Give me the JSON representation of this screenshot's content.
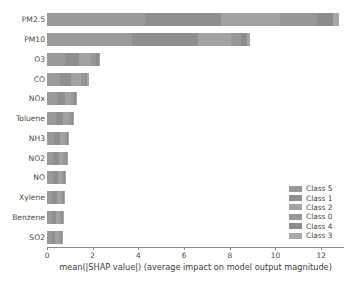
{
  "chart_data": {
    "type": "bar",
    "orientation": "horizontal",
    "stacked": true,
    "title": "",
    "xlabel": "mean(|SHAP value|) (average impact on model output magnitude)",
    "ylabel": "",
    "xlim": [
      0,
      13.0
    ],
    "grid": false,
    "legend_position": "lower-right",
    "xticks": [
      0,
      2,
      4,
      6,
      8,
      10,
      12
    ],
    "xtick_labels": [
      "0",
      "2",
      "4",
      "6",
      "8",
      "10",
      "12"
    ],
    "categories": [
      "PM2.5",
      "PM10",
      "O3",
      "CO",
      "NOx",
      "Toluene",
      "NH3",
      "NO2",
      "NO",
      "Xylene",
      "Benzene",
      "SO2"
    ],
    "series": [
      {
        "name": "Class 5",
        "color": "#9a9a9a",
        "values": [
          4.3,
          3.7,
          0.8,
          0.55,
          0.42,
          0.38,
          0.3,
          0.28,
          0.26,
          0.24,
          0.22,
          0.2
        ]
      },
      {
        "name": "Class 1",
        "color": "#8f8f8f",
        "values": [
          3.3,
          2.9,
          0.62,
          0.5,
          0.36,
          0.32,
          0.26,
          0.24,
          0.22,
          0.2,
          0.19,
          0.17
        ]
      },
      {
        "name": "Class 2",
        "color": "#a2a2a2",
        "values": [
          2.6,
          1.45,
          0.5,
          0.42,
          0.28,
          0.25,
          0.21,
          0.2,
          0.18,
          0.17,
          0.16,
          0.15
        ]
      },
      {
        "name": "Class 0",
        "color": "#979797",
        "values": [
          1.6,
          0.45,
          0.22,
          0.18,
          0.14,
          0.13,
          0.11,
          0.1,
          0.1,
          0.09,
          0.09,
          0.08
        ]
      },
      {
        "name": "Class 4",
        "color": "#8c8c8c",
        "values": [
          0.7,
          0.25,
          0.12,
          0.1,
          0.08,
          0.07,
          0.06,
          0.06,
          0.05,
          0.05,
          0.05,
          0.04
        ]
      },
      {
        "name": "Class 3",
        "color": "#a8a8a8",
        "values": [
          0.3,
          0.15,
          0.08,
          0.07,
          0.05,
          0.05,
          0.04,
          0.04,
          0.04,
          0.03,
          0.03,
          0.03
        ]
      }
    ],
    "totals": [
      12.8,
      8.9,
      2.34,
      1.82,
      1.33,
      1.2,
      0.98,
      0.92,
      0.85,
      0.78,
      0.74,
      0.67
    ],
    "legend_entries": [
      "Class 5",
      "Class 1",
      "Class 2",
      "Class 0",
      "Class 4",
      "Class 3"
    ]
  },
  "axes": {
    "x_title": "mean(|SHAP value|) (average impact on model output magnitude)"
  }
}
